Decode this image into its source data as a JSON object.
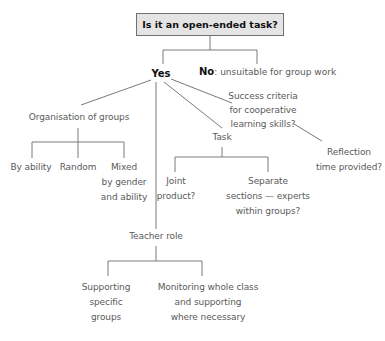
{
  "root": {
    "question": "Is it an open-ended task?"
  },
  "answers": {
    "yes": {
      "label": "Yes"
    },
    "no": {
      "label": "No",
      "note": ": unsuitable for group work"
    }
  },
  "branches": {
    "organisation": {
      "label": "Organisation of groups",
      "children": [
        {
          "lines": [
            "By ability"
          ]
        },
        {
          "lines": [
            "Random"
          ]
        },
        {
          "lines": [
            "Mixed",
            "by gender",
            "and ability"
          ]
        }
      ]
    },
    "task": {
      "label": "Task",
      "children": [
        {
          "lines": [
            "Joint",
            "product?"
          ]
        },
        {
          "lines": [
            "Separate",
            "sections — experts",
            "within groups?"
          ]
        }
      ]
    },
    "success": {
      "lines": [
        "Success criteria",
        "for cooperative",
        "learning skills?"
      ],
      "child": {
        "lines": [
          "Reflection",
          "time provided?"
        ]
      }
    },
    "teacher": {
      "label": "Teacher role",
      "children": [
        {
          "lines": [
            "Supporting",
            "specific",
            "groups"
          ]
        },
        {
          "lines": [
            "Monitoring whole class",
            "and supporting",
            "where necessary"
          ]
        }
      ]
    }
  },
  "colors": {
    "line": "#777777",
    "text": "#5a5a5a",
    "box_fill": "#e4e4e4",
    "box_border": "#707070"
  }
}
